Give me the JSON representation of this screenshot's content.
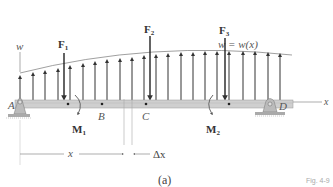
{
  "diagram": {
    "type": "beam_distributed_load",
    "axis_labels": {
      "w": "w",
      "x_axis": "x"
    },
    "load_curve_label": "w = w(x)",
    "points": {
      "A": "A",
      "B": "B",
      "C": "C",
      "D": "D"
    },
    "forces": [
      {
        "label": "F",
        "sub": "1"
      },
      {
        "label": "F",
        "sub": "2"
      },
      {
        "label": "F",
        "sub": "3"
      }
    ],
    "moments": [
      {
        "label": "M",
        "sub": "1"
      },
      {
        "label": "M",
        "sub": "2"
      }
    ],
    "dimensions": {
      "x": "x",
      "dx": "Δx"
    },
    "subfigure": "(a)",
    "figure_label": "Fig. 4-9",
    "colors": {
      "beam": "#c8c8c8",
      "arrows": "#333333",
      "curve": "#888888"
    }
  }
}
